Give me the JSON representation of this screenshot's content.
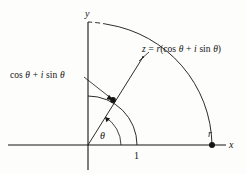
{
  "figure": {
    "kind": "complex-plane-polar-form-diagram",
    "background_color": "#fdfdfc",
    "ink_color": "#141414"
  },
  "axes": {
    "x_label": "x",
    "y_label": "y",
    "origin_px": [
      88,
      145
    ],
    "x_axis_from_px": [
      8,
      145
    ],
    "x_axis_to_px": [
      226,
      145
    ],
    "y_axis_from_px": [
      88,
      170
    ],
    "y_axis_to_px": [
      88,
      22
    ]
  },
  "ticks": {
    "unit_label": "1",
    "unit_x_px": 137,
    "r_label": "r",
    "r_x_px": 212
  },
  "arcs": {
    "unit_circle_radius_px": 49,
    "outer_circle_radius_px": 124,
    "outer_dashed_near_y_axis": true
  },
  "labels": {
    "unit_point": "cos θ + i sin θ",
    "unit_point_parts": {
      "cos": "cos",
      "theta1": "θ",
      "plus": "+",
      "i": "i",
      "sin": "sin",
      "theta2": "θ"
    },
    "z_point": "z = r(cos θ + i sin θ)",
    "z_point_parts": {
      "z": "z",
      "eq": "=",
      "r": "r",
      "open": "(",
      "cos": "cos",
      "theta1": "θ",
      "plus": "+",
      "i": "i",
      "sin": "sin",
      "theta2": "θ",
      "close": ")"
    },
    "angle": "θ"
  },
  "points": {
    "unit_point_px": [
      113,
      100
    ],
    "z_point_px": [
      143,
      57
    ],
    "r_point_px": [
      212,
      145
    ]
  }
}
